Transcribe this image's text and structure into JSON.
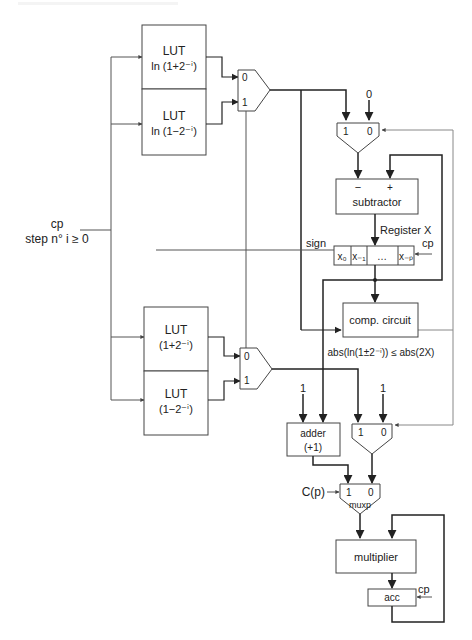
{
  "diagram": {
    "inputs": {
      "cp_label": "cp",
      "step_label": "step n° i ≥ 0",
      "c_p_label": "C(p)"
    },
    "luts": [
      {
        "title": "LUT",
        "func": "ln (1+2⁻ⁱ)"
      },
      {
        "title": "LUT",
        "func": "ln (1−2⁻ⁱ)"
      },
      {
        "title": "LUT",
        "func": "(1+2⁻ⁱ)"
      },
      {
        "title": "LUT",
        "func": "(1−2⁻ⁱ)"
      }
    ],
    "mux_top": {
      "in0": "0",
      "in1": "1"
    },
    "mux_bottom": {
      "in0": "0",
      "in1": "1"
    },
    "mux_sub": {
      "in1": "1",
      "in0": "0",
      "const": "0"
    },
    "subtractor": {
      "label": "subtractor",
      "minus": "−",
      "plus": "+"
    },
    "register": {
      "label": "Register X",
      "sign_label": "sign",
      "cp_label": "cp",
      "cells": [
        "x₀",
        "x₋₁",
        "…",
        "x₋ₚ"
      ]
    },
    "comp_circuit": {
      "label": "comp. circuit",
      "condition": "abs(ln(1±2⁻ⁱ)) ≤ abs(2X)"
    },
    "adder": {
      "label": "adder",
      "sub": "(+1)",
      "const": "1"
    },
    "mux_mult": {
      "in1": "1",
      "in0": "0",
      "const": "1"
    },
    "muxp": {
      "label": "muxp",
      "in1": "1",
      "in0": "0"
    },
    "multiplier": {
      "label": "multiplier"
    },
    "acc": {
      "label": "acc",
      "cp_label": "cp"
    }
  }
}
